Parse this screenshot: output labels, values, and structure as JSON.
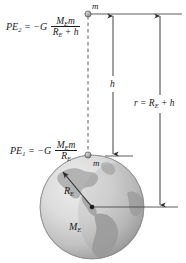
{
  "figure": {
    "equations": {
      "pe2": {
        "lhs": "PE",
        "lhs_sub": "2",
        "operator": "= −G",
        "numerator": "M",
        "numerator_sub": "E",
        "numerator_tail": "m",
        "denominator": "R",
        "denominator_sub": "E",
        "denominator_tail": "+ h",
        "plain": "PE2 = -G (ME m)/(RE + h)"
      },
      "pe1": {
        "lhs": "PE",
        "lhs_sub": "1",
        "operator": "= −G",
        "numerator": "M",
        "numerator_sub": "E",
        "numerator_tail": "m",
        "denominator": "R",
        "denominator_sub": "E",
        "denominator_tail": "",
        "plain": "PE1 = -G (ME m)/RE"
      }
    },
    "labels": {
      "mass_top": "m",
      "mass_surface": "m",
      "height": "h",
      "radius_main": "R",
      "radius_main_sub": "E",
      "mass_earth": "M",
      "mass_earth_sub": "E",
      "distance_r_lhs": "r",
      "distance_r_eq": "= R",
      "distance_r_sub": "E",
      "distance_r_tail": "+ h"
    },
    "colors": {
      "ink": "#1a1a1a",
      "rule": "#444444",
      "background": "#ffffff",
      "earth_ocean_light": "#e3e3e3",
      "earth_ocean_mid": "#c9c9c9",
      "earth_ocean_dark": "#9a9a9a",
      "earth_land": "#a8a8a8",
      "earth_outline": "#8c8c8c"
    },
    "geometry": {
      "earth_center_x": 92,
      "earth_center_y": 207,
      "earth_radius": 52,
      "mass_top_x": 88,
      "mass_top_y": 14,
      "mass_surface_x": 88,
      "mass_surface_y": 155,
      "h_line_x": 113,
      "r_line_x": 160,
      "top_rule_y": 14,
      "surface_rule_y": 156,
      "center_rule_y": 207
    }
  }
}
